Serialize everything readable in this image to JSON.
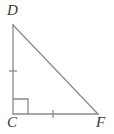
{
  "figure": {
    "kind": "geometry-diagram",
    "shape": "right-triangle",
    "background_color": "#ffffff",
    "stroke_color": "#8a8a8a",
    "label_color": "#3a3a3a",
    "labels": {
      "top_left": "D",
      "bottom_left": "C",
      "bottom_right": "F"
    },
    "vertices": {
      "D": {
        "x": 13,
        "y": 25
      },
      "C": {
        "x": 13,
        "y": 114
      },
      "F": {
        "x": 98,
        "y": 114
      }
    },
    "sides": [
      {
        "name": "CD",
        "from": "C",
        "to": "D",
        "ticks": 1
      },
      {
        "name": "CF",
        "from": "C",
        "to": "F",
        "ticks": 1
      },
      {
        "name": "DF",
        "from": "D",
        "to": "F",
        "ticks": 0
      }
    ],
    "right_angle": {
      "at": "C",
      "marker": "square",
      "size": 15
    },
    "tick_marks": [
      {
        "on": "CD",
        "cx": 13,
        "cy": 71,
        "orientation": "horizontal",
        "half_length": 4
      },
      {
        "on": "CF",
        "cx": 53,
        "cy": 114,
        "orientation": "vertical",
        "half_length": 4
      }
    ]
  }
}
